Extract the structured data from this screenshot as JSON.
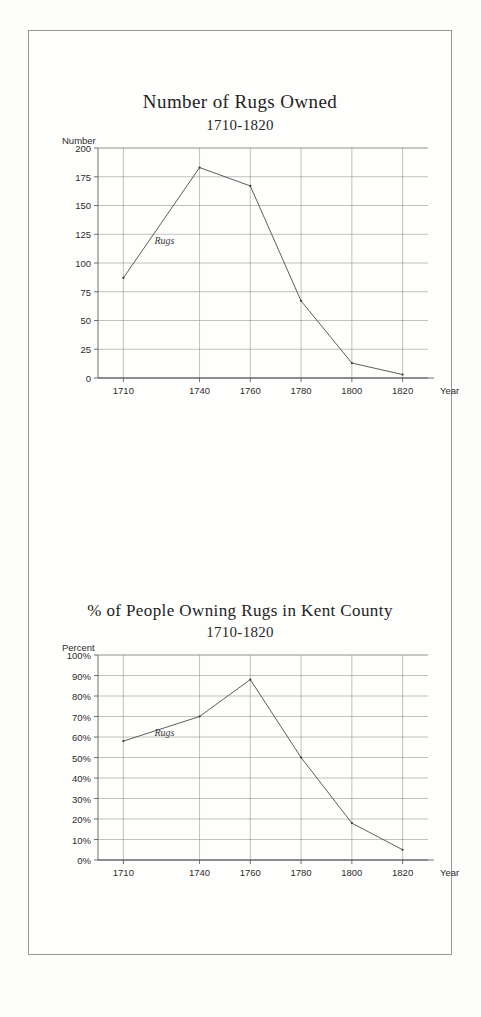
{
  "document": {
    "kind": "scanned-figure-page"
  },
  "figures": [
    {
      "id": "rugs-owned",
      "title": "Number of Rugs Owned",
      "subtitle": "1710-1820",
      "y_axis_title": "Number",
      "x_axis_title": "Year",
      "series_label": "Rugs"
    },
    {
      "id": "percent-owning",
      "title": "% of People Owning Rugs in Kent County",
      "subtitle": "1710-1820",
      "y_axis_title": "Percent",
      "x_axis_title": "Year",
      "series_label": "Rugs"
    }
  ],
  "chart_data": [
    {
      "type": "line",
      "title": "Number of Rugs Owned",
      "subtitle": "1710-1820",
      "xlabel": "Year",
      "ylabel": "Number",
      "x": [
        1710,
        1740,
        1760,
        1780,
        1800,
        1820
      ],
      "xtick_labels": [
        "1710",
        "1740",
        "1760",
        "1780",
        "1800",
        "1820"
      ],
      "values": [
        87,
        183,
        167,
        67,
        13,
        3
      ],
      "series": [
        {
          "name": "Rugs",
          "values": [
            87,
            183,
            167,
            67,
            13,
            3
          ]
        }
      ],
      "ylim": [
        0,
        200
      ],
      "ytick_values": [
        0,
        25,
        50,
        75,
        100,
        125,
        150,
        175,
        200
      ],
      "ytick_labels": [
        "0",
        "25",
        "50",
        "75",
        "100",
        "125",
        "150",
        "175",
        "200"
      ],
      "xlim": [
        1700,
        1830
      ],
      "grid": true,
      "legend": "inline-series-label"
    },
    {
      "type": "line",
      "title": "% of People Owning Rugs in Kent County",
      "subtitle": "1710-1820",
      "xlabel": "Year",
      "ylabel": "Percent",
      "x": [
        1710,
        1740,
        1760,
        1780,
        1800,
        1820
      ],
      "xtick_labels": [
        "1710",
        "1740",
        "1760",
        "1780",
        "1800",
        "1820"
      ],
      "values": [
        58,
        70,
        88,
        50,
        18,
        5
      ],
      "series": [
        {
          "name": "Rugs",
          "values": [
            58,
            70,
            88,
            50,
            18,
            5
          ]
        }
      ],
      "ylim": [
        0,
        100
      ],
      "ytick_values": [
        0,
        10,
        20,
        30,
        40,
        50,
        60,
        70,
        80,
        90,
        100
      ],
      "ytick_labels": [
        "0%",
        "10%",
        "20%",
        "30%",
        "40%",
        "50%",
        "60%",
        "70%",
        "80%",
        "90%",
        "100%"
      ],
      "xlim": [
        1700,
        1830
      ],
      "grid": true,
      "legend": "inline-series-label"
    }
  ],
  "colors": {
    "line": "#4a4a4a",
    "grid": "#8e8e8a",
    "axis": "#4c4c4c",
    "text": "#2c2c2c",
    "page": "#fefefd",
    "border": "#9a9a93"
  }
}
